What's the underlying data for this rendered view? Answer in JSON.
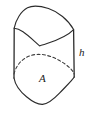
{
  "figure": {
    "kind": "solid-prism-diagram",
    "background_color": "#ffffff",
    "stroke_color": "#2b2b2b",
    "stroke_width": 1.1,
    "dashed_stroke_color": "#3c3c3c",
    "dash_pattern": "3 2.4",
    "labels": {
      "area": "A",
      "height": "h"
    },
    "geometry": {
      "top_face": {
        "name": "top-face",
        "vertices": [
          [
            14,
            28
          ],
          [
            30,
            7
          ],
          [
            56,
            10
          ],
          [
            74,
            30
          ],
          [
            40,
            46
          ]
        ],
        "style": "solid"
      },
      "hidden_base_curve": {
        "name": "hidden-base-curve",
        "from": [
          14,
          74
        ],
        "to": [
          74,
          74
        ],
        "style": "dashed"
      },
      "left_edge": {
        "name": "left-vertical-edge",
        "from": [
          14,
          28
        ],
        "to": [
          14,
          78
        ],
        "style": "solid"
      },
      "right_edge": {
        "name": "right-vertical-edge",
        "from": [
          74,
          30
        ],
        "to": [
          74,
          77
        ],
        "style": "solid"
      },
      "bottom_face": {
        "name": "bottom-face-front-curve",
        "from": [
          14,
          78
        ],
        "to": [
          74,
          77
        ],
        "style": "solid"
      }
    }
  }
}
